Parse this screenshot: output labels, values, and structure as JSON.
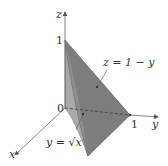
{
  "figure": {
    "axes": {
      "x_label": "x",
      "y_label": "y",
      "z_label": "z"
    },
    "ticks": {
      "origin": "0",
      "z_one": "1",
      "y_one": "1"
    },
    "annotations": {
      "plane": "z = 1 − y",
      "curve": "y = √x"
    },
    "colors": {
      "axis": "#555555",
      "front_face": "#8f8f8f",
      "curved_face": "#b0b0b0",
      "plane_face": "#7a7a7a",
      "edge": "#555555"
    }
  }
}
